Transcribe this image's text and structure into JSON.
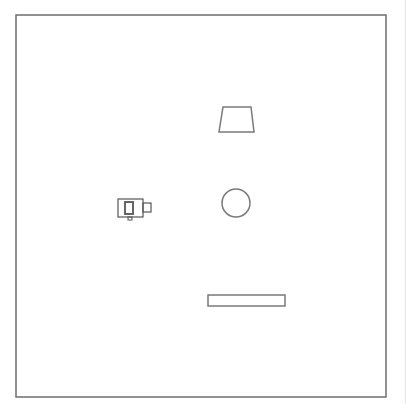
{
  "diagram": {
    "type": "top-down room layout",
    "colors": {
      "background": "#ffffff",
      "stroke": "#7a7a7a",
      "frame_stroke": "#6e6e6e",
      "icon_stroke": "#555555"
    },
    "frame": {
      "x": 16,
      "y": 15,
      "width": 370,
      "height": 382
    },
    "objects": [
      {
        "id": "trapezoid",
        "shape": "trapezoid",
        "points": [
          [
            223,
            107
          ],
          [
            251,
            107
          ],
          [
            254,
            132
          ],
          [
            219,
            132
          ]
        ]
      },
      {
        "id": "circle",
        "shape": "circle",
        "cx": 236,
        "cy": 203,
        "r": 14
      },
      {
        "id": "bar",
        "shape": "rectangle",
        "x": 208,
        "y": 295,
        "width": 77,
        "height": 11
      },
      {
        "id": "camera",
        "shape": "camera-icon",
        "icon": "camera-icon",
        "body": {
          "x": 118,
          "y": 199,
          "width": 25,
          "height": 18
        },
        "inner": {
          "x": 125,
          "y": 202,
          "width": 8,
          "height": 12
        },
        "lens": {
          "x": 143,
          "y": 203,
          "width": 8,
          "height": 9
        },
        "foot": {
          "x": 128,
          "y": 217,
          "width": 4,
          "height": 3
        }
      }
    ]
  }
}
